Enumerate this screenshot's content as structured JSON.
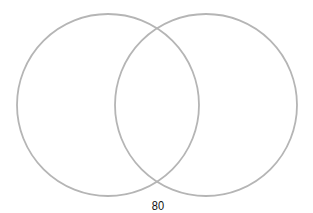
{
  "diagram": {
    "type": "venn",
    "circles": [
      {
        "id": "left",
        "cx": 108,
        "cy": 105,
        "r": 91
      },
      {
        "id": "right",
        "cx": 206,
        "cy": 105,
        "r": 91
      }
    ],
    "stroke_color": "#b5b5b5",
    "label": "80"
  }
}
